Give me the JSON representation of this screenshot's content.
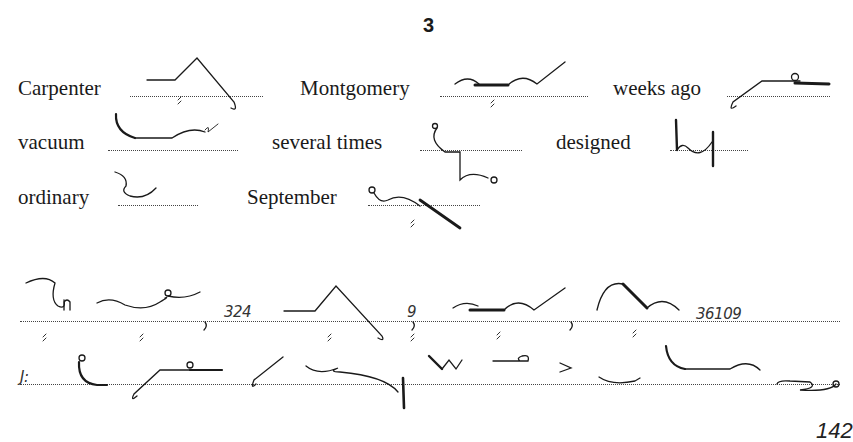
{
  "page": {
    "exercise_number": "3",
    "page_number": "142"
  },
  "vocabulary": {
    "rows": [
      [
        {
          "word": "Carpenter",
          "outline": "carpenter-outline"
        },
        {
          "word": "Montgomery",
          "outline": "montgomery-outline"
        },
        {
          "word": "weeks ago",
          "outline": "weeks-ago-outline"
        }
      ],
      [
        {
          "word": "vacuum",
          "outline": "vacuum-outline"
        },
        {
          "word": "several times",
          "outline": "several-times-outline"
        },
        {
          "word": "designed",
          "outline": "designed-outline"
        }
      ],
      [
        {
          "word": "ordinary",
          "outline": "ordinary-outline"
        },
        {
          "word": "September",
          "outline": "september-outline"
        }
      ]
    ]
  },
  "passage": {
    "line1": {
      "numbers": [
        "324",
        "9",
        "36109"
      ],
      "punctuation": [
        ",",
        ",",
        ","
      ]
    },
    "line2": {
      "salutation_mark": "J:"
    }
  }
}
